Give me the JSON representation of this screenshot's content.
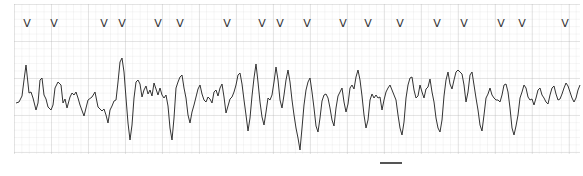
{
  "strip": {
    "type": "ECG rhythm strip",
    "trace_color": "#333333",
    "grid_color": "#c8c8c8",
    "background": "#ffffff",
    "marker_glyph": "V",
    "markers_x": [
      27,
      54,
      104,
      122,
      158,
      180,
      227,
      262,
      280,
      307,
      343,
      368,
      400,
      437,
      464,
      501,
      522,
      565
    ],
    "waveform_points": "16,103 19,102 22,96 24,80 26,65 29,93 31,92 33,98 36,110 38,103 40,80 42,78 44,95 46,99 48,107 51,110 53,105 55,88 58,82 61,85 63,103 65,99 67,108 70,97 72,93 74,95 76,92 78,98 80,105 84,116 88,100 92,97 95,92 98,107 102,111 104,109 106,115 108,123 110,110 112,106 114,101 116,100 118,82 120,62 122,58 124,72 126,98 128,123 130,140 132,125 134,98 136,82 138,80 140,84 142,97 144,90 146,86 148,94 150,90 152,96 154,83 156,89 158,95 160,88 162,95 164,98 166,95 168,106 170,128 172,140 174,118 176,88 178,82 180,77 182,75 184,88 186,98 188,115 190,123 192,112 194,105 196,97 198,89 200,85 202,94 204,100 206,102 208,97 210,99 212,103 214,92 216,90 218,96 220,88 222,84 224,97 226,113 228,106 230,99 232,97 234,92 236,85 238,75 240,73 242,84 244,100 246,115 248,131 250,118 252,96 254,78 256,64 258,82 260,102 262,117 264,125 266,112 268,98 270,100 272,95 274,82 276,67 278,80 280,100 282,108 284,95 286,80 288,70 290,82 292,100 294,115 296,128 298,138 300,150 302,128 304,105 306,90 308,82 310,78 312,92 314,108 316,126 318,132 320,118 322,101 324,95 326,94 328,98 330,108 332,120 334,126 336,108 338,96 340,92 342,88 344,102 346,112 348,104 350,88 352,85 354,89 356,77 358,70 360,80 362,96 364,115 366,128 368,120 370,100 372,94 374,98 376,95 378,98 380,97 382,110 384,100 386,92 388,88 390,85 392,90 394,95 396,100 398,115 400,128 402,135 404,122 406,98 408,85 410,78 412,77 414,90 416,98 418,96 420,85 422,92 424,98 426,89 428,87 430,79 432,92 434,102 436,118 438,128 440,132 442,120 444,96 446,80 448,72 450,84 452,89 454,80 456,72 458,70 460,72 462,74 464,85 466,102 468,92 470,75 472,72 474,85 476,98 478,110 480,125 482,131 484,115 486,98 488,94 490,88 492,95 494,98 496,100 498,100 500,102 502,95 504,85 506,84 508,92 510,108 512,128 514,135 516,126 518,115 520,98 522,92 524,85 526,88 528,97 530,100 532,99 534,105 536,98 538,90 540,88 542,95 544,98 546,102 548,104 550,95 552,88 554,86 556,94 558,100 560,99 562,94 564,88 566,83 568,86 570,92 572,98 574,102 576,98 578,90 580,85"
  }
}
